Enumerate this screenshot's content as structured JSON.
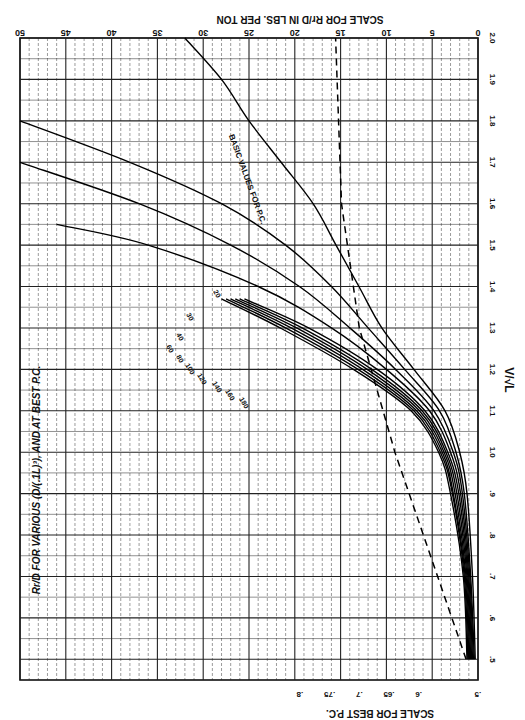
{
  "chart_data": {
    "type": "line",
    "orientation_note": "figure rotated 90deg; x axis (V/sqrt L) runs bottom-to-top along right edge",
    "xlabel": "V/√L",
    "ylabel_top": "SCALE FOR Rr/D IN LBS. PER TON",
    "ylabel_bottom": "SCALE FOR BEST P.C.",
    "x_ticks": [
      0.5,
      0.6,
      0.7,
      0.8,
      0.9,
      1.0,
      1.1,
      1.2,
      1.3,
      1.4,
      1.5,
      1.6,
      1.7,
      1.8,
      1.9,
      2.0
    ],
    "x_range": [
      0.45,
      2.0
    ],
    "rr_scale_ticks": [
      0,
      5,
      10,
      15,
      20,
      25,
      30,
      35,
      40,
      45,
      50
    ],
    "rr_scale_range": [
      0,
      50
    ],
    "pc_scale_ticks": [
      0.5,
      0.55,
      0.6,
      0.65,
      0.7,
      0.8
    ],
    "series": [
      {
        "name": "20",
        "x": [
          0.5,
          0.7,
          0.9,
          1.0,
          1.1,
          1.2,
          1.3,
          1.4,
          1.5,
          1.6,
          1.7,
          1.8,
          1.9,
          2.0
        ],
        "values": [
          0.3,
          0.6,
          1.2,
          2.0,
          3.6,
          7.0,
          10.5,
          13.0,
          15.5,
          18.0,
          21.5,
          25.0,
          28.0,
          32.0
        ]
      },
      {
        "name": "30",
        "x": [
          0.5,
          0.7,
          0.9,
          1.0,
          1.1,
          1.2,
          1.3,
          1.4,
          1.5,
          1.6,
          1.7,
          1.8
        ],
        "values": [
          0.4,
          0.8,
          1.5,
          2.4,
          4.2,
          8.0,
          12.0,
          16.0,
          21.0,
          28.0,
          38.0,
          50.0
        ]
      },
      {
        "name": "40",
        "x": [
          0.5,
          0.7,
          0.9,
          1.0,
          1.1,
          1.2,
          1.3,
          1.4,
          1.5,
          1.6,
          1.7
        ],
        "values": [
          0.5,
          0.9,
          1.7,
          2.7,
          4.8,
          9.0,
          14.0,
          19.5,
          27.0,
          37.0,
          50.0
        ]
      },
      {
        "name": "60",
        "x": [
          0.5,
          0.7,
          0.9,
          1.0,
          1.1,
          1.2,
          1.3,
          1.4,
          1.5,
          1.55
        ],
        "values": [
          0.6,
          1.0,
          1.9,
          3.0,
          5.3,
          10.0,
          16.0,
          24.0,
          36.0,
          46.0
        ]
      },
      {
        "name": "80",
        "x": [
          0.5,
          0.7,
          0.9,
          1.0,
          1.1,
          1.2,
          1.3,
          1.37
        ],
        "values": [
          0.7,
          1.1,
          2.1,
          3.3,
          5.8,
          11.0,
          18.5,
          25.5
        ]
      },
      {
        "name": "100",
        "x": [
          0.5,
          0.7,
          0.9,
          1.0,
          1.1,
          1.2,
          1.3,
          1.37
        ],
        "values": [
          0.8,
          1.2,
          2.3,
          3.5,
          6.1,
          11.6,
          19.2,
          26.0
        ]
      },
      {
        "name": "120",
        "x": [
          0.5,
          0.7,
          0.9,
          1.0,
          1.1,
          1.2,
          1.3,
          1.37
        ],
        "values": [
          0.9,
          1.3,
          2.5,
          3.7,
          6.4,
          12.1,
          19.8,
          26.5
        ]
      },
      {
        "name": "140",
        "x": [
          0.5,
          0.7,
          0.9,
          1.0,
          1.1,
          1.2,
          1.3,
          1.37
        ],
        "values": [
          1.0,
          1.4,
          2.7,
          3.9,
          6.7,
          12.6,
          20.4,
          27.0
        ]
      },
      {
        "name": "160",
        "x": [
          0.5,
          0.7,
          0.9,
          1.0,
          1.1,
          1.2,
          1.3,
          1.37
        ],
        "values": [
          1.1,
          1.5,
          2.8,
          4.1,
          7.0,
          13.1,
          21.0,
          27.5
        ]
      },
      {
        "name": "180",
        "x": [
          0.5,
          0.7,
          0.9,
          1.0,
          1.1,
          1.2,
          1.3,
          1.37
        ],
        "values": [
          1.2,
          1.6,
          3.0,
          4.3,
          7.3,
          13.6,
          21.6,
          28.0
        ]
      }
    ],
    "reference_line": {
      "name": "BASIC VALUES FOR P.C.",
      "style": "dashed",
      "x": [
        0.5,
        1.0,
        1.3,
        1.6,
        2.0
      ],
      "values_pc_scale": [
        0.52,
        0.64,
        0.7,
        0.73,
        0.74
      ]
    },
    "grid": true,
    "legend": "curve labels inline"
  },
  "labels": {
    "title_main": "FOR VARIOUS",
    "title_frac_top": "Rr",
    "title_frac_bottom": "D",
    "title_param_top": "D",
    "title_param_bottom": "(.1L)³",
    "title_tail": "AND AT BEST P.C.",
    "top_axis_label": "SCALE FOR Rr/D IN LBS. PER TON",
    "bottom_axis_label": "SCALE FOR BEST P.C.",
    "x_axis_label": "V/√L",
    "ref_line_label": "BASIC VALUES FOR P.C.",
    "top_ticks": [
      "50",
      "45",
      "40",
      "35",
      "30",
      "25",
      "20",
      "15",
      "10",
      "5",
      "0"
    ],
    "right_ticks": [
      "2.0",
      "1.9",
      "1.8",
      "1.7",
      "1.6",
      "1.5",
      "1.4",
      "1.3",
      "1.2",
      "1.1",
      "1.0",
      ".9",
      ".8",
      ".7",
      ".6",
      ".5"
    ],
    "bottom_ticks": [
      ".8",
      ".75",
      ".7",
      ".65",
      ".6",
      ".5"
    ],
    "curve_labels": [
      "20",
      "30",
      "40",
      "60",
      "80",
      "100",
      "120",
      "140",
      "160",
      "180"
    ]
  }
}
